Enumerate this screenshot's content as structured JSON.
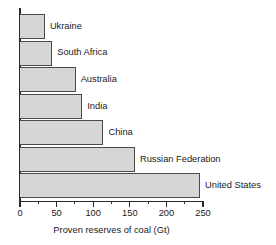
{
  "chart_data": {
    "type": "bar",
    "orientation": "horizontal",
    "title": "",
    "xlabel": "Proven reserves of coal (Gt)",
    "ylabel": "",
    "categories": [
      "Ukraine",
      "South Africa",
      "Australia",
      "India",
      "China",
      "Russian Federation",
      "United States"
    ],
    "values": [
      34,
      44,
      76,
      85,
      114,
      157,
      246
    ],
    "units": "Gt",
    "xlim": [
      0,
      250
    ],
    "xticks": [
      0,
      50,
      100,
      150,
      200,
      250
    ],
    "xtick_labels": [
      "0",
      "50",
      "100",
      "150",
      "200",
      "250"
    ],
    "minor_tick_interval": 25,
    "grid": false,
    "legend": false,
    "bar_fill_color": "#d6d6d6",
    "bar_edge_color": "#4a4a4a",
    "axis_color": "#2b2b2b",
    "background_color": "#ffffff"
  }
}
